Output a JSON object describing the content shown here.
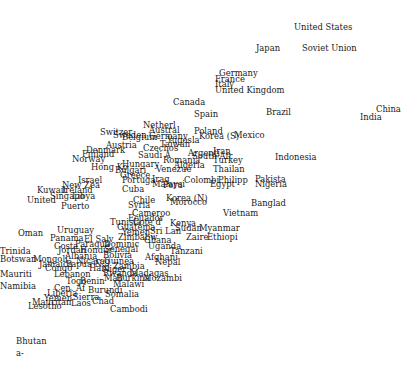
{
  "chart_data": {
    "type": "scatter",
    "title": "",
    "xlabel": "",
    "ylabel": "",
    "grid": false,
    "legend": null,
    "marker": "text-label",
    "note": "Points are country name labels; positions given in pixel coordinates (x,y of label's top-left) since no axes or tick labels are shown.",
    "points": [
      {
        "label": "United States",
        "x": 294,
        "y": 23
      },
      {
        "label": "Japan",
        "x": 256,
        "y": 44
      },
      {
        "label": "Soviet Union",
        "x": 302,
        "y": 44
      },
      {
        "label": "Germany",
        "x": 219,
        "y": 69
      },
      {
        "label": "France",
        "x": 215,
        "y": 75
      },
      {
        "label": "Italy",
        "x": 215,
        "y": 80
      },
      {
        "label": "United Kingdom",
        "x": 215,
        "y": 86
      },
      {
        "label": "Canada",
        "x": 173,
        "y": 98
      },
      {
        "label": "Spain",
        "x": 194,
        "y": 110
      },
      {
        "label": "Brazil",
        "x": 266,
        "y": 108
      },
      {
        "label": "China",
        "x": 376,
        "y": 105
      },
      {
        "label": "India",
        "x": 360,
        "y": 113
      },
      {
        "label": "Netherl",
        "x": 143,
        "y": 121
      },
      {
        "label": "Austral",
        "x": 149,
        "y": 126
      },
      {
        "label": "Switzer",
        "x": 100,
        "y": 128
      },
      {
        "label": "Sweden",
        "x": 113,
        "y": 131
      },
      {
        "label": "Belgium",
        "x": 122,
        "y": 133
      },
      {
        "label": "Germany",
        "x": 149,
        "y": 132
      },
      {
        "label": "Yugosla",
        "x": 167,
        "y": 136
      },
      {
        "label": "Taiwan",
        "x": 160,
        "y": 140
      },
      {
        "label": "Poland",
        "x": 194,
        "y": 127
      },
      {
        "label": "Korea (S)",
        "x": 199,
        "y": 132
      },
      {
        "label": "Mexico",
        "x": 234,
        "y": 131
      },
      {
        "label": "Austria",
        "x": 106,
        "y": 141
      },
      {
        "label": "Czechos",
        "x": 143,
        "y": 144
      },
      {
        "label": "Denmark",
        "x": 86,
        "y": 146
      },
      {
        "label": "Finland",
        "x": 82,
        "y": 150
      },
      {
        "label": "Norway",
        "x": 72,
        "y": 155
      },
      {
        "label": "Saudi A",
        "x": 138,
        "y": 151
      },
      {
        "label": "Argenti",
        "x": 188,
        "y": 149
      },
      {
        "label": "South Afr",
        "x": 192,
        "y": 152
      },
      {
        "label": "Iran",
        "x": 213,
        "y": 147
      },
      {
        "label": "Romania",
        "x": 163,
        "y": 156
      },
      {
        "label": "Turkey",
        "x": 213,
        "y": 156
      },
      {
        "label": "Indonesia",
        "x": 275,
        "y": 153
      },
      {
        "label": "Hungary",
        "x": 122,
        "y": 160
      },
      {
        "label": "Algeria",
        "x": 174,
        "y": 161
      },
      {
        "label": "Hong Ko",
        "x": 91,
        "y": 163
      },
      {
        "label": "Venezue",
        "x": 156,
        "y": 165
      },
      {
        "label": "Thailan",
        "x": 213,
        "y": 165
      },
      {
        "label": "Bulgari",
        "x": 115,
        "y": 166
      },
      {
        "label": "Greece",
        "x": 120,
        "y": 171
      },
      {
        "label": "Israel",
        "x": 78,
        "y": 176
      },
      {
        "label": "Portuga",
        "x": 122,
        "y": 176
      },
      {
        "label": "Iraq",
        "x": 152,
        "y": 175
      },
      {
        "label": "Colombi",
        "x": 184,
        "y": 176
      },
      {
        "label": "Philipp",
        "x": 218,
        "y": 176
      },
      {
        "label": "Pakista",
        "x": 255,
        "y": 175
      },
      {
        "label": "New Zea",
        "x": 62,
        "y": 181
      },
      {
        "label": "Malaysi",
        "x": 152,
        "y": 180
      },
      {
        "label": "Peru",
        "x": 163,
        "y": 181
      },
      {
        "label": "Egypt",
        "x": 210,
        "y": 180
      },
      {
        "label": "Nigeria",
        "x": 255,
        "y": 180
      },
      {
        "label": "Kuwait",
        "x": 37,
        "y": 186
      },
      {
        "label": "Ireland",
        "x": 62,
        "y": 186
      },
      {
        "label": "Cuba",
        "x": 122,
        "y": 185
      },
      {
        "label": "Singapo",
        "x": 50,
        "y": 192
      },
      {
        "label": "Libya",
        "x": 72,
        "y": 192
      },
      {
        "label": "United",
        "x": 27,
        "y": 196
      },
      {
        "label": "Chile",
        "x": 133,
        "y": 196
      },
      {
        "label": "Korea (N)",
        "x": 166,
        "y": 194
      },
      {
        "label": "Morocco",
        "x": 170,
        "y": 198
      },
      {
        "label": "Banglad",
        "x": 251,
        "y": 199
      },
      {
        "label": "Puerto",
        "x": 61,
        "y": 202
      },
      {
        "label": "Syria",
        "x": 128,
        "y": 201
      },
      {
        "label": "Vietnam",
        "x": 223,
        "y": 209
      },
      {
        "label": "Cameroo",
        "x": 132,
        "y": 209
      },
      {
        "label": "Ecuador",
        "x": 128,
        "y": 214
      },
      {
        "label": "Tunisia",
        "x": 110,
        "y": 218
      },
      {
        "label": "Cote d'",
        "x": 133,
        "y": 218
      },
      {
        "label": "Kenya",
        "x": 170,
        "y": 219
      },
      {
        "label": "Sudan",
        "x": 175,
        "y": 224
      },
      {
        "label": "Myanmar",
        "x": 199,
        "y": 224
      },
      {
        "label": "Guatema",
        "x": 117,
        "y": 223
      },
      {
        "label": "Yemen",
        "x": 122,
        "y": 228
      },
      {
        "label": "Sri Lan",
        "x": 150,
        "y": 227
      },
      {
        "label": "Zaire",
        "x": 186,
        "y": 233
      },
      {
        "label": "Ethiopi",
        "x": 207,
        "y": 233
      },
      {
        "label": "Oman",
        "x": 18,
        "y": 229
      },
      {
        "label": "Uruguay",
        "x": 57,
        "y": 226
      },
      {
        "label": "Panama",
        "x": 50,
        "y": 234
      },
      {
        "label": "El Salv",
        "x": 84,
        "y": 235
      },
      {
        "label": "Zimbabw",
        "x": 118,
        "y": 233
      },
      {
        "label": "Ghana",
        "x": 144,
        "y": 236
      },
      {
        "label": "Paragua",
        "x": 75,
        "y": 240
      },
      {
        "label": "Dominic",
        "x": 104,
        "y": 240
      },
      {
        "label": "Uganda",
        "x": 148,
        "y": 242
      },
      {
        "label": "Costa",
        "x": 54,
        "y": 242
      },
      {
        "label": "Senegal",
        "x": 104,
        "y": 245
      },
      {
        "label": "Jordan",
        "x": 58,
        "y": 246
      },
      {
        "label": "Hondur",
        "x": 80,
        "y": 246
      },
      {
        "label": "Tanzani",
        "x": 170,
        "y": 247
      },
      {
        "label": "Trinida",
        "x": 0,
        "y": 247
      },
      {
        "label": "Bolivia",
        "x": 103,
        "y": 251
      },
      {
        "label": "Afghani",
        "x": 145,
        "y": 253
      },
      {
        "label": "Mongoli",
        "x": 33,
        "y": 255
      },
      {
        "label": "Albania",
        "x": 65,
        "y": 252
      },
      {
        "label": "Botswan",
        "x": 0,
        "y": 255
      },
      {
        "label": "Nepal",
        "x": 155,
        "y": 258
      },
      {
        "label": "Guinea",
        "x": 104,
        "y": 257
      },
      {
        "label": "Nicarag",
        "x": 76,
        "y": 257
      },
      {
        "label": "Jamaica",
        "x": 39,
        "y": 260
      },
      {
        "label": "Papua N",
        "x": 66,
        "y": 260
      },
      {
        "label": "Zambia",
        "x": 113,
        "y": 262
      },
      {
        "label": "Haiti",
        "x": 89,
        "y": 264
      },
      {
        "label": "Niger",
        "x": 102,
        "y": 265
      },
      {
        "label": "Congo",
        "x": 45,
        "y": 264
      },
      {
        "label": "Rwanda",
        "x": 103,
        "y": 269
      },
      {
        "label": "Madagas",
        "x": 130,
        "y": 269
      },
      {
        "label": "Mauriti",
        "x": 0,
        "y": 270
      },
      {
        "label": "Lebanon",
        "x": 54,
        "y": 270
      },
      {
        "label": "Mali",
        "x": 104,
        "y": 274
      },
      {
        "label": "Burkina",
        "x": 116,
        "y": 274
      },
      {
        "label": "Mozambi",
        "x": 143,
        "y": 274
      },
      {
        "label": "Togo",
        "x": 66,
        "y": 277
      },
      {
        "label": "Benin",
        "x": 80,
        "y": 277
      },
      {
        "label": "Namibia",
        "x": 0,
        "y": 282
      },
      {
        "label": "Malawi",
        "x": 113,
        "y": 280
      },
      {
        "label": "Cen. Af",
        "x": 54,
        "y": 284
      },
      {
        "label": "Burundi",
        "x": 88,
        "y": 286
      },
      {
        "label": "Liberia",
        "x": 47,
        "y": 289
      },
      {
        "label": "Somalia",
        "x": 105,
        "y": 290
      },
      {
        "label": "Yemen",
        "x": 44,
        "y": 294
      },
      {
        "label": "Sierra",
        "x": 73,
        "y": 293
      },
      {
        "label": "Mauritan",
        "x": 32,
        "y": 298
      },
      {
        "label": "Lesotho",
        "x": 28,
        "y": 302
      },
      {
        "label": "Laos",
        "x": 71,
        "y": 299
      },
      {
        "label": "Chad",
        "x": 92,
        "y": 297
      },
      {
        "label": "Cambodi",
        "x": 110,
        "y": 305
      },
      {
        "label": "Bhutan",
        "x": 16,
        "y": 337
      },
      {
        "label": "a-",
        "x": 16,
        "y": 349
      }
    ]
  }
}
